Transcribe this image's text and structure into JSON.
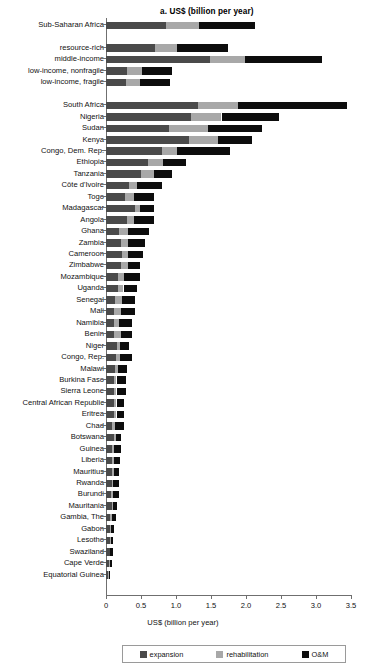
{
  "chart_data": {
    "type": "bar",
    "subtype": "stacked-horizontal",
    "title": "a. US$ (billion per year)",
    "xlabel": "US$ (billion per year)",
    "ylabel": "",
    "xlim": [
      0,
      3.5
    ],
    "xticks": [
      "0",
      "0.5",
      "1.0",
      "1.5",
      "2.0",
      "2.5",
      "3.0",
      "3.5"
    ],
    "xtick_values": [
      0,
      0.5,
      1.0,
      1.5,
      2.0,
      2.5,
      3.0,
      3.5
    ],
    "grid": false,
    "legend_position": "bottom",
    "series": [
      {
        "name": "expansion",
        "color": "#4a4a4a",
        "values": [
          0.86,
          0.0,
          0.7,
          1.48,
          0.3,
          0.28,
          0.0,
          1.31,
          1.22,
          0.9,
          1.18,
          0.8,
          0.6,
          0.5,
          0.33,
          0.27,
          0.42,
          0.3,
          0.18,
          0.21,
          0.23,
          0.22,
          0.17,
          0.17,
          0.13,
          0.12,
          0.12,
          0.12,
          0.16,
          0.14,
          0.13,
          0.11,
          0.12,
          0.12,
          0.11,
          0.09,
          0.11,
          0.09,
          0.09,
          0.08,
          0.08,
          0.07,
          0.08,
          0.06,
          0.05,
          0.05,
          0.05,
          0.04,
          0.03,
          0.03
        ]
      },
      {
        "name": "rehabilitation",
        "color": "#a8a8a8",
        "values": [
          0.47,
          0.0,
          0.31,
          0.5,
          0.21,
          0.21,
          0.0,
          0.57,
          0.43,
          0.56,
          0.42,
          0.22,
          0.21,
          0.18,
          0.11,
          0.13,
          0.07,
          0.1,
          0.14,
          0.1,
          0.08,
          0.1,
          0.09,
          0.08,
          0.1,
          0.1,
          0.07,
          0.09,
          0.04,
          0.06,
          0.04,
          0.04,
          0.03,
          0.03,
          0.04,
          0.04,
          0.03,
          0.03,
          0.03,
          0.03,
          0.02,
          0.03,
          0.02,
          0.03,
          0.02,
          0.02,
          0.01,
          0.01,
          0.01,
          0.01
        ]
      },
      {
        "name": "O&M",
        "color": "#0d0d0d",
        "values": [
          0.8,
          0.0,
          0.73,
          1.11,
          0.43,
          0.42,
          0.0,
          1.56,
          0.82,
          0.77,
          0.49,
          0.75,
          0.33,
          0.26,
          0.36,
          0.29,
          0.2,
          0.29,
          0.29,
          0.25,
          0.22,
          0.17,
          0.23,
          0.19,
          0.18,
          0.19,
          0.18,
          0.16,
          0.13,
          0.17,
          0.13,
          0.14,
          0.13,
          0.11,
          0.11,
          0.13,
          0.07,
          0.09,
          0.08,
          0.08,
          0.08,
          0.09,
          0.05,
          0.05,
          0.05,
          0.03,
          0.04,
          0.03,
          0.02,
          0.01
        ]
      }
    ],
    "categories": [
      "Sub-Saharan Africa",
      "",
      "resource-rich",
      "middle-income",
      "low-income, nonfragile",
      "low-income, fragile",
      "",
      "South Africa",
      "Nigeria",
      "Sudan",
      "Kenya",
      "Congo, Dem. Rep.",
      "Ethiopia",
      "Tanzania",
      "Côte d'Ivoire",
      "Togo",
      "Madagascar",
      "Angola",
      "Ghana",
      "Zambia",
      "Cameroon",
      "Zimbabwe",
      "Mozambique",
      "Uganda",
      "Senegal",
      "Mali",
      "Namibia",
      "Benin",
      "Niger",
      "Congo, Rep.",
      "Malawi",
      "Burkina Faso",
      "Sierra Leone",
      "Central African Republic",
      "Eritrea",
      "Chad",
      "Botswana",
      "Guinea",
      "Liberia",
      "Mauritius",
      "Rwanda",
      "Burundi",
      "Mauritania",
      "Gambia, The",
      "Gabon",
      "Lesotho",
      "Swaziland",
      "Cape Verde",
      "Equatorial Guinea",
      ""
    ],
    "totals": [
      2.13,
      0.0,
      1.74,
      3.09,
      0.94,
      0.91,
      0.0,
      3.44,
      2.47,
      2.23,
      2.09,
      1.77,
      1.14,
      0.94,
      0.8,
      0.69,
      0.69,
      0.69,
      0.61,
      0.56,
      0.53,
      0.49,
      0.49,
      0.44,
      0.41,
      0.41,
      0.37,
      0.37,
      0.33,
      0.41,
      0.3,
      0.29,
      0.28,
      0.26,
      0.26,
      0.26,
      0.21,
      0.21,
      0.2,
      0.19,
      0.18,
      0.19,
      0.15,
      0.14,
      0.12,
      0.1,
      0.1,
      0.08,
      0.06,
      0.0
    ]
  },
  "legend": {
    "items": [
      {
        "label": "expansion",
        "key": "expansion"
      },
      {
        "label": "rehabilitation",
        "key": "rehabilitation"
      },
      {
        "label": "O&M",
        "key": "om"
      }
    ]
  }
}
